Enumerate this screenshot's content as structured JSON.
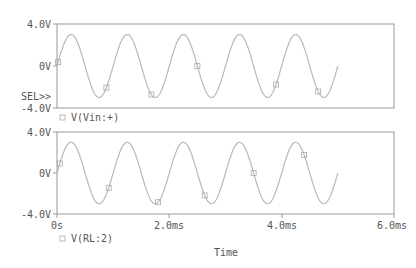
{
  "colors": {
    "frame": "#9a9a9a",
    "trace": "#b8b8b8",
    "text": "#555555",
    "marker": "#aaaaaa"
  },
  "selector_label": "SEL>>",
  "x_axis": {
    "label": "Time",
    "ticks": [
      "0s",
      "2.0ms",
      "4.0ms",
      "6.0ms"
    ]
  },
  "plots": [
    {
      "y_ticks": [
        "4.0V",
        "0V",
        "-4.0V"
      ],
      "legend": "V(Vin:+)",
      "selected": true
    },
    {
      "y_ticks": [
        "4.0V",
        "0V",
        "-4.0V"
      ],
      "legend": "V(RL:2)",
      "selected": false
    }
  ],
  "chart_data": [
    {
      "type": "line",
      "title": "",
      "xlabel": "Time",
      "ylabel": "",
      "xlim": [
        0,
        6.0
      ],
      "x_unit": "ms",
      "ylim": [
        -4.0,
        4.0
      ],
      "y_unit": "V",
      "series": [
        {
          "name": "V(Vin:+)",
          "waveform": "sine",
          "amplitude": 3.0,
          "frequency_hz": 1000,
          "t_start_ms": 0,
          "t_end_ms": 5.0,
          "x": [
            0,
            0.25,
            0.5,
            0.75,
            1.0,
            1.25,
            1.5,
            1.75,
            2.0,
            2.25,
            2.5,
            2.75,
            3.0,
            3.25,
            3.5,
            3.75,
            4.0,
            4.25,
            4.5,
            4.75,
            5.0
          ],
          "values": [
            0,
            3,
            0,
            -3,
            0,
            3,
            0,
            -3,
            0,
            3,
            0,
            -3,
            0,
            3,
            0,
            -3,
            0,
            3,
            0,
            -3,
            0
          ]
        }
      ]
    },
    {
      "type": "line",
      "title": "",
      "xlabel": "Time",
      "ylabel": "",
      "xlim": [
        0,
        6.0
      ],
      "x_unit": "ms",
      "ylim": [
        -4.0,
        4.0
      ],
      "y_unit": "V",
      "series": [
        {
          "name": "V(RL:2)",
          "waveform": "sine",
          "amplitude": 3.0,
          "frequency_hz": 1000,
          "t_start_ms": 0,
          "t_end_ms": 5.0,
          "x": [
            0,
            0.25,
            0.5,
            0.75,
            1.0,
            1.25,
            1.5,
            1.75,
            2.0,
            2.25,
            2.5,
            2.75,
            3.0,
            3.25,
            3.5,
            3.75,
            4.0,
            4.25,
            4.5,
            4.75,
            5.0
          ],
          "values": [
            0,
            3,
            0,
            -3,
            0,
            3,
            0,
            -3,
            0,
            3,
            0,
            -3,
            0,
            3,
            0,
            -3,
            0,
            3,
            0,
            -3,
            0
          ]
        }
      ]
    }
  ]
}
